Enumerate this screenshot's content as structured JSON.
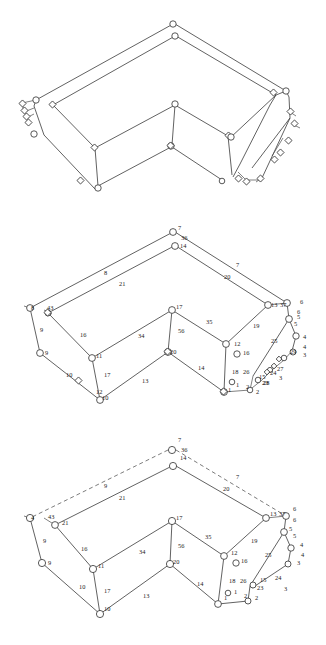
{
  "figure": {
    "views": [
      {
        "id": "top",
        "name": "wireframe-unlabeled",
        "labeled": false
      },
      {
        "id": "middle",
        "name": "wireframe-labeled-dense",
        "labeled": true
      },
      {
        "id": "bottom",
        "name": "wireframe-labeled-clean",
        "labeled": true
      }
    ]
  },
  "nodes_middle": [
    {
      "id": "n7",
      "label": "7",
      "x": 178,
      "y": 12
    },
    {
      "id": "n36",
      "label": "36",
      "x": 181,
      "y": 22
    },
    {
      "id": "n14",
      "label": "14",
      "x": 180,
      "y": 30
    },
    {
      "id": "n8L",
      "label": "8",
      "x": 31,
      "y": 92
    },
    {
      "id": "n43",
      "label": "43",
      "x": 47,
      "y": 92
    },
    {
      "id": "n9",
      "label": "9",
      "x": 45,
      "y": 137
    },
    {
      "id": "n10",
      "label": "10",
      "x": 102,
      "y": 182
    },
    {
      "id": "n12b",
      "label": "12",
      "x": 96,
      "y": 176
    },
    {
      "id": "n11",
      "label": "11",
      "x": 96,
      "y": 140
    },
    {
      "id": "n17c",
      "label": "17",
      "x": 176,
      "y": 91
    },
    {
      "id": "n20c",
      "label": "20",
      "x": 170,
      "y": 136
    },
    {
      "id": "n1",
      "label": "1",
      "x": 228,
      "y": 174
    },
    {
      "id": "n12r",
      "label": "12",
      "x": 234,
      "y": 128
    },
    {
      "id": "n16r",
      "label": "16",
      "x": 243,
      "y": 137
    },
    {
      "id": "n15r",
      "label": "15",
      "x": 259,
      "y": 161
    },
    {
      "id": "n2r",
      "label": "2",
      "x": 256,
      "y": 176
    },
    {
      "id": "n23",
      "label": "23",
      "x": 262,
      "y": 167
    },
    {
      "id": "n24",
      "label": "24",
      "x": 270,
      "y": 157
    },
    {
      "id": "n27",
      "label": "27",
      "x": 277,
      "y": 153
    },
    {
      "id": "n29",
      "label": "29",
      "x": 290,
      "y": 136
    },
    {
      "id": "n3r",
      "label": "3",
      "x": 303,
      "y": 139
    },
    {
      "id": "n4r",
      "label": "4",
      "x": 303,
      "y": 121
    },
    {
      "id": "n4r2",
      "label": "4",
      "x": 303,
      "y": 131
    },
    {
      "id": "n5r",
      "label": "5",
      "x": 294,
      "y": 108
    },
    {
      "id": "n5r2",
      "label": "5",
      "x": 297,
      "y": 101
    },
    {
      "id": "n6r",
      "label": "6",
      "x": 300,
      "y": 86
    },
    {
      "id": "n6r2",
      "label": "6",
      "x": 297,
      "y": 96
    },
    {
      "id": "n13",
      "label": "13",
      "x": 271,
      "y": 89
    },
    {
      "id": "n37",
      "label": "37",
      "x": 280,
      "y": 89
    }
  ],
  "edges_middle": [
    {
      "label": "8",
      "x": 104,
      "y": 57
    },
    {
      "label": "21",
      "x": 119,
      "y": 68
    },
    {
      "label": "7",
      "x": 236,
      "y": 49
    },
    {
      "label": "20",
      "x": 224,
      "y": 61
    },
    {
      "label": "9",
      "x": 40,
      "y": 114
    },
    {
      "label": "10",
      "x": 66,
      "y": 159
    },
    {
      "label": "16",
      "x": 80,
      "y": 119
    },
    {
      "label": "17",
      "x": 104,
      "y": 159
    },
    {
      "label": "34",
      "x": 138,
      "y": 120
    },
    {
      "label": "56",
      "x": 178,
      "y": 115
    },
    {
      "label": "35",
      "x": 206,
      "y": 106
    },
    {
      "label": "13",
      "x": 142,
      "y": 165
    },
    {
      "label": "14",
      "x": 198,
      "y": 152
    },
    {
      "label": "19",
      "x": 253,
      "y": 110
    },
    {
      "label": "25",
      "x": 271,
      "y": 125
    },
    {
      "label": "18",
      "x": 232,
      "y": 156
    },
    {
      "label": "26",
      "x": 243,
      "y": 156
    },
    {
      "label": "1",
      "x": 236,
      "y": 169
    },
    {
      "label": "2",
      "x": 246,
      "y": 171
    },
    {
      "label": "3",
      "x": 279,
      "y": 162
    },
    {
      "label": "28",
      "x": 263,
      "y": 167
    }
  ],
  "nodes_bottom": [
    {
      "id": "b7",
      "label": "7",
      "x": 178,
      "y": 14
    },
    {
      "id": "b36",
      "label": "36",
      "x": 181,
      "y": 24
    },
    {
      "id": "b14",
      "label": "14",
      "x": 180,
      "y": 32
    },
    {
      "id": "b4L",
      "label": "4",
      "x": 31,
      "y": 92
    },
    {
      "id": "b43",
      "label": "43",
      "x": 48,
      "y": 91
    },
    {
      "id": "b21",
      "label": "21",
      "x": 62,
      "y": 97
    },
    {
      "id": "b9",
      "label": "9",
      "x": 48,
      "y": 137
    },
    {
      "id": "b11",
      "label": "11",
      "x": 98,
      "y": 140
    },
    {
      "id": "b10",
      "label": "10",
      "x": 104,
      "y": 183
    },
    {
      "id": "b17",
      "label": "17",
      "x": 176,
      "y": 92
    },
    {
      "id": "b20",
      "label": "20",
      "x": 173,
      "y": 136
    },
    {
      "id": "b12",
      "label": "12",
      "x": 231,
      "y": 127
    },
    {
      "id": "b16",
      "label": "16",
      "x": 241,
      "y": 135
    },
    {
      "id": "b1",
      "label": "1",
      "x": 224,
      "y": 172
    },
    {
      "id": "b2",
      "label": "2",
      "x": 255,
      "y": 172
    },
    {
      "id": "b15",
      "label": "15",
      "x": 260,
      "y": 154
    },
    {
      "id": "b23",
      "label": "23",
      "x": 257,
      "y": 162
    },
    {
      "id": "b3",
      "label": "3",
      "x": 297,
      "y": 137
    },
    {
      "id": "b4",
      "label": "4",
      "x": 301,
      "y": 129
    },
    {
      "id": "b4b",
      "label": "4",
      "x": 300,
      "y": 119
    },
    {
      "id": "b5",
      "label": "5",
      "x": 289,
      "y": 103
    },
    {
      "id": "b5b",
      "label": "5",
      "x": 293,
      "y": 110
    },
    {
      "id": "b6",
      "label": "6",
      "x": 293,
      "y": 83
    },
    {
      "id": "b6b",
      "label": "6",
      "x": 293,
      "y": 94
    },
    {
      "id": "b13",
      "label": "13",
      "x": 270,
      "y": 88
    },
    {
      "id": "b37",
      "label": "37",
      "x": 279,
      "y": 88
    }
  ],
  "edges_bottom": [
    {
      "label": "9",
      "x": 104,
      "y": 60
    },
    {
      "label": "21",
      "x": 119,
      "y": 72
    },
    {
      "label": "7",
      "x": 236,
      "y": 51
    },
    {
      "label": "20",
      "x": 223,
      "y": 63
    },
    {
      "label": "9",
      "x": 43,
      "y": 115
    },
    {
      "label": "10",
      "x": 79,
      "y": 161
    },
    {
      "label": "16",
      "x": 81,
      "y": 123
    },
    {
      "label": "17",
      "x": 104,
      "y": 165
    },
    {
      "label": "34",
      "x": 139,
      "y": 126
    },
    {
      "label": "56",
      "x": 178,
      "y": 120
    },
    {
      "label": "35",
      "x": 205,
      "y": 111
    },
    {
      "label": "13",
      "x": 143,
      "y": 170
    },
    {
      "label": "14",
      "x": 197,
      "y": 158
    },
    {
      "label": "19",
      "x": 251,
      "y": 115
    },
    {
      "label": "25",
      "x": 265,
      "y": 129
    },
    {
      "label": "18",
      "x": 229,
      "y": 155
    },
    {
      "label": "26",
      "x": 240,
      "y": 155
    },
    {
      "label": "1",
      "x": 234,
      "y": 166
    },
    {
      "label": "2",
      "x": 244,
      "y": 170
    },
    {
      "label": "24",
      "x": 275,
      "y": 152
    },
    {
      "label": "3",
      "x": 284,
      "y": 163
    }
  ]
}
